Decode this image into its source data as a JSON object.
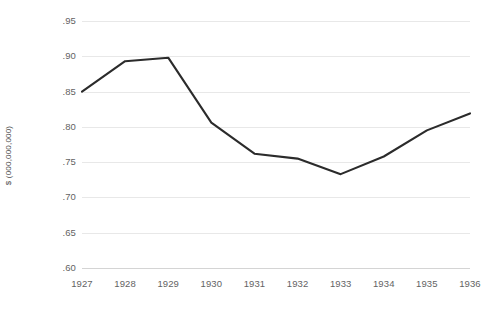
{
  "chart_data": {
    "type": "line",
    "title": "",
    "subtitle": "",
    "xlabel": "",
    "ylabel": "$ (000,000,000)",
    "categories": [
      "1927",
      "1928",
      "1929",
      "1930",
      "1931",
      "1932",
      "1933",
      "1934",
      "1935",
      "1936"
    ],
    "x": [
      1927,
      1928,
      1929,
      1930,
      1931,
      1932,
      1933,
      1934,
      1935,
      1936
    ],
    "values": [
      0.85,
      0.893,
      0.898,
      0.806,
      0.762,
      0.755,
      0.733,
      0.758,
      0.795,
      0.819
    ],
    "series": [
      {
        "name": "",
        "values": [
          0.85,
          0.893,
          0.898,
          0.806,
          0.762,
          0.755,
          0.733,
          0.758,
          0.795,
          0.819
        ],
        "color": "#2b2b2b"
      }
    ],
    "ylim": [
      0.6,
      0.95
    ],
    "xlim": [
      1927,
      1936
    ],
    "y_ticks": [
      0.6,
      0.65,
      0.7,
      0.75,
      0.8,
      0.85,
      0.9,
      0.95
    ],
    "y_tick_labels": [
      ".60",
      ".65",
      ".70",
      ".75",
      ".80",
      ".85",
      ".90",
      ".95"
    ],
    "x_tick_labels": [
      "1927",
      "1928",
      "1929",
      "1930",
      "1931",
      "1932",
      "1933",
      "1934",
      "1935",
      "1936"
    ],
    "grid": true,
    "grid_axis": "y",
    "legend": false,
    "legend_position": "none",
    "annotations": [],
    "colors": {
      "line": "#2b2b2b",
      "gridline": "#e8e8e8",
      "baseline": "#d4d4d4",
      "tick_label": "#636363",
      "axis_title": "#4d4d4d",
      "background": "#ffffff"
    }
  }
}
